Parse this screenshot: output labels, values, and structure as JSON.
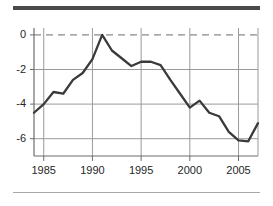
{
  "chart_data": {
    "type": "line",
    "title": "",
    "subtitle": "",
    "xlabel": "",
    "ylabel": "",
    "xlim": [
      1984,
      2007
    ],
    "ylim": [
      -7,
      0.4
    ],
    "xticks": [
      1985,
      1990,
      1995,
      2000,
      2005
    ],
    "xtick_labels": [
      "1985",
      "1990",
      "1995",
      "2000",
      "2005"
    ],
    "yticks": [
      0,
      -2,
      -4,
      -6
    ],
    "ytick_labels": [
      "0",
      "-2",
      "-4",
      "-6"
    ],
    "grid": true,
    "grid_color": "#9a9a9a",
    "zero_line_style": "dashed",
    "legend": null,
    "legend_position": "none",
    "line_color": "#3a3a3a",
    "line_width": 2.3,
    "x": [
      1984,
      1985,
      1986,
      1987,
      1988,
      1989,
      1990,
      1991,
      1992,
      1993,
      1994,
      1995,
      1996,
      1997,
      1998,
      1999,
      2000,
      2001,
      2002,
      2003,
      2004,
      2005,
      2006,
      2007
    ],
    "values": [
      -4.5,
      -4.0,
      -3.3,
      -3.4,
      -2.6,
      -2.2,
      -1.4,
      0.0,
      -0.9,
      -1.35,
      -1.8,
      -1.55,
      -1.55,
      -1.75,
      -2.6,
      -3.4,
      -4.2,
      -3.8,
      -4.5,
      -4.7,
      -5.6,
      -6.1,
      -6.15,
      -5.1
    ],
    "series": [
      {
        "name": "series-1",
        "values": [
          -4.5,
          -4.0,
          -3.3,
          -3.4,
          -2.6,
          -2.2,
          -1.4,
          0.0,
          -0.9,
          -1.35,
          -1.8,
          -1.55,
          -1.55,
          -1.75,
          -2.6,
          -3.4,
          -4.2,
          -3.8,
          -4.5,
          -4.7,
          -5.6,
          -6.1,
          -6.15,
          -5.1
        ]
      }
    ]
  },
  "axes": {
    "y_labels": [
      "0",
      "-2",
      "-4",
      "-6"
    ],
    "x_labels": [
      "1985",
      "1990",
      "1995",
      "2000",
      "2005"
    ]
  }
}
